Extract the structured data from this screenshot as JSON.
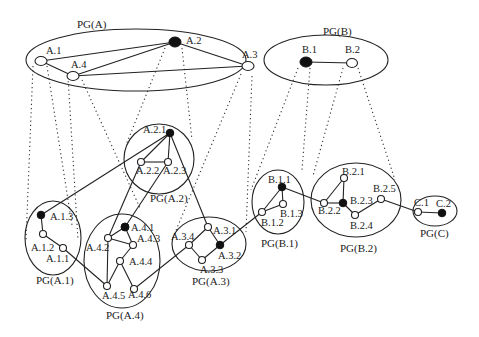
{
  "diagram": {
    "groups": {
      "PGA": "PG(A)",
      "PGB": "PG(B)",
      "PGA1": "PG(A.1)",
      "PGA2": "PG(A.2)",
      "PGA3": "PG(A.3)",
      "PGA4": "PG(A.4)",
      "PGB1": "PG(B.1)",
      "PGB2": "PG(B.2)",
      "PGC": "PG(C)"
    },
    "nodes": {
      "A1": "A.1",
      "A2": "A.2",
      "A3": "A.3",
      "A4": "A.4",
      "B1": "B.1",
      "B2": "B.2",
      "A21": "A.2.1",
      "A22": "A.2.2",
      "A23": "A.2.3",
      "A11": "A.1.1",
      "A12": "A.1.2",
      "A13": "A.1.3",
      "A41": "A.4.1",
      "A42": "A.4.2",
      "A43": "A.4.3",
      "A44": "A.4.4",
      "A45": "A.4.5",
      "A46": "A.4.6",
      "A31": "A.3.1",
      "A32": "A.3.2",
      "A33": "A.3.3",
      "A34": "A.3.4",
      "B11": "B.1.1",
      "B12": "B.1.2",
      "B13": "B.1.3",
      "B21": "B.2.1",
      "B22": "B.2.2",
      "B23": "B.2.3",
      "B24": "B.2.4",
      "B25": "B.2.5",
      "C1": "C.1",
      "C2": "C.2"
    },
    "solid_nodes": [
      "A.2",
      "B.1",
      "A.2.1",
      "A.1.3",
      "A.4.1",
      "A.3.2",
      "B.1.1",
      "B.2.3",
      "C.2"
    ],
    "colors": {
      "stroke": "#222222",
      "solid_node": "#111111",
      "background": "#ffffff"
    }
  }
}
